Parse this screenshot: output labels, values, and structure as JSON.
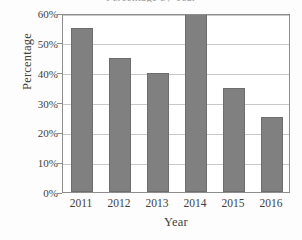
{
  "chart_data": {
    "type": "bar",
    "title": "",
    "title_fragment": "Percentage by Year",
    "categories": [
      "2011",
      "2012",
      "2013",
      "2014",
      "2015",
      "2016"
    ],
    "values": [
      55,
      45,
      40,
      60,
      35,
      25
    ],
    "xlabel": "Year",
    "ylabel": "Percentage",
    "ylim": [
      0,
      60
    ],
    "ytick_values": [
      0,
      10,
      20,
      30,
      40,
      50,
      60
    ],
    "ytick_labels": [
      "0%",
      "10%",
      "20%",
      "30%",
      "40%",
      "50%",
      "60%"
    ],
    "grid": true,
    "grid_axis": "y",
    "legend": false,
    "bar_color": "#808080",
    "bar_edge_color": "#6d6d6d",
    "gridline_color": "#c9c9c9",
    "axis_color": "#8d8d8d",
    "text_color": "#3f3f3f",
    "background_color": "#ffffff"
  }
}
